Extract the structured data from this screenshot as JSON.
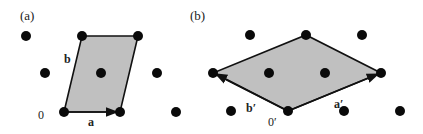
{
  "panels": [
    {
      "label": "(a)",
      "origin_label": "0",
      "vector_a_label": "a",
      "vector_b_label": "b",
      "cell": "primitive parallelogram",
      "cell_fill": "#c0c0c0"
    },
    {
      "label": "(b)",
      "origin_label": "0′",
      "vector_a_label": "a′",
      "vector_b_label": "b′",
      "cell": "rhombus",
      "cell_fill": "#c0c0c0"
    }
  ],
  "colors": {
    "dot": "#0a0a0a",
    "edge": "#111111",
    "fill": "#c0c0c0"
  }
}
